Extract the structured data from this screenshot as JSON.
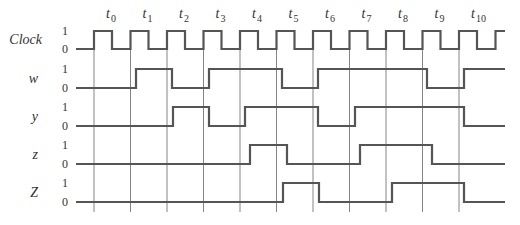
{
  "diagram": {
    "type": "timing-diagram",
    "time_labels": [
      {
        "base": "t",
        "sub": "0"
      },
      {
        "base": "t",
        "sub": "1"
      },
      {
        "base": "t",
        "sub": "2"
      },
      {
        "base": "t",
        "sub": "3"
      },
      {
        "base": "t",
        "sub": "4"
      },
      {
        "base": "t",
        "sub": "5"
      },
      {
        "base": "t",
        "sub": "6"
      },
      {
        "base": "t",
        "sub": "7"
      },
      {
        "base": "t",
        "sub": "8"
      },
      {
        "base": "t",
        "sub": "9"
      },
      {
        "base": "t",
        "sub": "10"
      }
    ],
    "gridlines_x": [
      94,
      130.5,
      167,
      203.5,
      240,
      276.5,
      313,
      349.5,
      386,
      422.5,
      459
    ],
    "grid_top": 50,
    "grid_bottom": 212,
    "level_labels": {
      "high": "1",
      "low": "0"
    },
    "colors": {
      "wave": "#555555",
      "grid": "#666666",
      "text": "#333333"
    },
    "signals": [
      {
        "name": "Clock",
        "label": "Clock",
        "y_high": 31,
        "y_low": 49,
        "start_x": 76,
        "end_x": 505,
        "initial": 0,
        "transitions": [
          94,
          112,
          130.5,
          148.5,
          167,
          185,
          203.5,
          221.5,
          240,
          258,
          276.5,
          294.5,
          313,
          331,
          349.5,
          367.5,
          386,
          404,
          422.5,
          440.5,
          459,
          477,
          495.5
        ]
      },
      {
        "name": "w",
        "label": "w",
        "y_high": 69,
        "y_low": 88,
        "start_x": 76,
        "end_x": 505,
        "initial": 0,
        "transitions": [
          136,
          172,
          209,
          282,
          318,
          427,
          464
        ]
      },
      {
        "name": "y",
        "label": "y",
        "y_high": 107,
        "y_low": 126,
        "start_x": 76,
        "end_x": 505,
        "initial": 0,
        "transitions": [
          173,
          209,
          245,
          318,
          355,
          464
        ]
      },
      {
        "name": "z",
        "label": "z",
        "y_high": 145,
        "y_low": 164,
        "start_x": 76,
        "end_x": 505,
        "initial": 0,
        "transitions": [
          250,
          287,
          360,
          432
        ]
      },
      {
        "name": "Z",
        "label": "Z",
        "y_high": 183,
        "y_low": 202,
        "start_x": 76,
        "end_x": 505,
        "initial": 0,
        "transitions": [
          283,
          319,
          392,
          464
        ]
      }
    ]
  }
}
